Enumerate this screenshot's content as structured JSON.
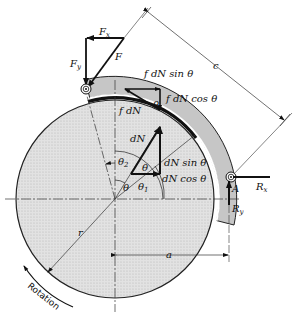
{
  "diagram": {
    "title": "",
    "type": "mechanical free-body diagram (external drum brake shoe)",
    "labels": {
      "Fx": "F",
      "Fx_sub": "x",
      "Fy": "F",
      "Fy_sub": "y",
      "F": "F",
      "c": "c",
      "f_dN_sin": "f dN sin θ",
      "f_dN_cos": "f dN cos θ",
      "f_dN": "f dN",
      "theta_small": "θ",
      "dN": "dN",
      "theta_vec": "θ",
      "dN_sin": "dN sin θ",
      "dN_cos": "dN cos θ",
      "theta2": "θ",
      "theta2_sub": "2",
      "theta": "θ",
      "theta1": "θ",
      "theta1_sub": "1",
      "A": "A",
      "Rx": "R",
      "Rx_sub": "x",
      "Ry": "R",
      "Ry_sub": "y",
      "r": "r",
      "a": "a",
      "rotation": "Rotation"
    },
    "colors": {
      "drum_fill": "#d9d9d9",
      "shoe_fill": "#c8c8c8",
      "lining": "#111111",
      "line": "#222222"
    }
  }
}
